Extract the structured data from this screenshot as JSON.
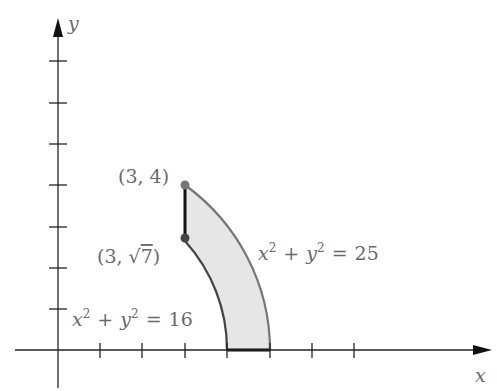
{
  "diagram": {
    "type": "region-between-circles",
    "axes": {
      "x_label": "x",
      "y_label": "y",
      "x_ticks": [
        1,
        2,
        3,
        4,
        5,
        6,
        7
      ],
      "y_ticks": [
        1,
        2,
        3,
        4,
        5,
        6,
        7
      ]
    },
    "curves": [
      {
        "equation": "x² + y² = 16",
        "lhs_x": "x",
        "lhs_y": "y",
        "exp": "2",
        "plus": "+",
        "eq": "=",
        "rhs": "16",
        "radius": 4
      },
      {
        "equation": "x² + y² = 25",
        "lhs_x": "x",
        "lhs_y": "y",
        "exp": "2",
        "plus": "+",
        "eq": "=",
        "rhs": "25",
        "radius": 5
      }
    ],
    "points": [
      {
        "label": "(3, 4)",
        "x": 3,
        "y": 4
      },
      {
        "label_prefix": "(3, ",
        "label_sqrt": "√",
        "label_radicand": "7",
        "label_suffix": ")",
        "x": 3,
        "y": 2.6458
      }
    ],
    "colors": {
      "axis": "#222222",
      "outer_curve": "#777777",
      "inner_curve": "#444444",
      "fill": "#e6e6e6",
      "point": "#777777",
      "label": "#6a6a6a"
    }
  }
}
